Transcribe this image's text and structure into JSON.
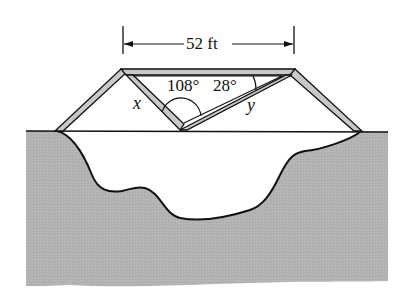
{
  "diagram": {
    "type": "bridge-truss-over-ravine",
    "span_label": "52 ft",
    "angles": [
      {
        "label": "108°",
        "vertex": "bottom-center",
        "description": "angle at lower vertex between inner members"
      },
      {
        "label": "28°",
        "vertex": "top-right",
        "description": "angle between top chord and diagonal y"
      }
    ],
    "sides": [
      {
        "label": "x",
        "description": "left inner diagonal member"
      },
      {
        "label": "y",
        "description": "right inner diagonal member"
      }
    ],
    "colors": {
      "ground_fill": "#b3b3b3",
      "truss_fill": "#c8c8c8",
      "line": "#111111",
      "background": "#ffffff"
    }
  }
}
